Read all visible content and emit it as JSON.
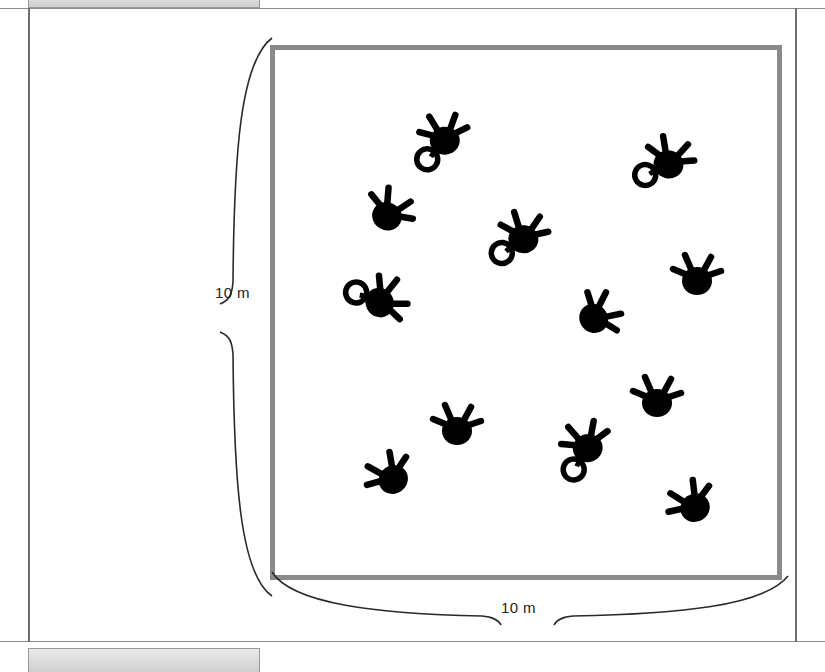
{
  "figure": {
    "type": "quadrat-plot-diagram",
    "box": {
      "width_label": "10 m",
      "height_label": "10 m"
    },
    "dimension_left_label": "10 m",
    "dimension_bottom_label": "10 m",
    "colors": {
      "quadrat_border": "#8a8a8a",
      "symbol_fill": "#000000",
      "bracket_stroke": "#2a2a2a",
      "page_border": "#6e6e6e",
      "strip_fill": "#dcdcdc",
      "label_text": "#232323"
    }
  },
  "strips": {
    "top_text": "",
    "bottom_text": ""
  },
  "chart_data": {
    "type": "scatter",
    "title": "",
    "xlabel": "10 m",
    "ylabel": "10 m",
    "xlim": [
      0,
      10
    ],
    "ylim": [
      0,
      10
    ],
    "grid": false,
    "legend": "none",
    "units": "m",
    "note": "Positions given in metres within the 10 m x 10 m quadrat; origin at lower-left corner of the box.",
    "marker_kinds": [
      {
        "id": "with-ring",
        "label": "symbol with open ring"
      },
      {
        "id": "plain",
        "label": "symbol without open ring"
      }
    ],
    "points": [
      {
        "id": 1,
        "x": 3.1,
        "y": 8.8,
        "kind": "with-ring",
        "ring_side": "left",
        "rotation": -8
      },
      {
        "id": 2,
        "x": 8.2,
        "y": 8.3,
        "kind": "with-ring",
        "ring_side": "left",
        "rotation": 14
      },
      {
        "id": 3,
        "x": 1.9,
        "y": 7.2,
        "kind": "plain",
        "ring_side": "none",
        "rotation": 28
      },
      {
        "id": 4,
        "x": 4.9,
        "y": 6.7,
        "kind": "with-ring",
        "ring_side": "left",
        "rotation": 6
      },
      {
        "id": 5,
        "x": 8.8,
        "y": 5.8,
        "kind": "plain",
        "ring_side": "none",
        "rotation": 0
      },
      {
        "id": 6,
        "x": 1.8,
        "y": 5.3,
        "kind": "with-ring",
        "ring_side": "left",
        "rotation": 62
      },
      {
        "id": 7,
        "x": 6.6,
        "y": 5.0,
        "kind": "plain",
        "ring_side": "none",
        "rotation": 50
      },
      {
        "id": 8,
        "x": 7.9,
        "y": 3.2,
        "kind": "plain",
        "ring_side": "none",
        "rotation": 0
      },
      {
        "id": 9,
        "x": 3.4,
        "y": 2.6,
        "kind": "plain",
        "ring_side": "none",
        "rotation": 0
      },
      {
        "id": 10,
        "x": 6.3,
        "y": 2.2,
        "kind": "with-ring",
        "ring_side": "left",
        "rotation": -18
      },
      {
        "id": 11,
        "x": 1.9,
        "y": 1.5,
        "kind": "plain",
        "ring_side": "none",
        "rotation": -38
      },
      {
        "id": 12,
        "x": 8.7,
        "y": 0.9,
        "kind": "plain",
        "ring_side": "none",
        "rotation": -35
      }
    ],
    "point_count": 12
  }
}
